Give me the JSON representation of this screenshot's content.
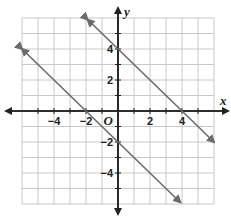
{
  "chart_data": {
    "type": "line",
    "title": "",
    "xlabel": "x",
    "ylabel": "y",
    "xlim": [
      -6,
      6
    ],
    "ylim": [
      -6,
      6
    ],
    "grid": true,
    "origin_label": "O",
    "x_ticks": [
      -4,
      -2,
      2,
      4
    ],
    "y_ticks": [
      4,
      2,
      -2,
      -4
    ],
    "x_tick_labels": [
      "−4",
      "−2",
      "2",
      "4"
    ],
    "y_tick_labels": [
      "4",
      "2",
      "−2",
      "−4"
    ],
    "series": [
      {
        "name": "line-upper",
        "equation": "y = -x + 4",
        "slope": -1,
        "intercept": 4,
        "x": [
          -1.9,
          6
        ],
        "y": [
          5.9,
          -2
        ],
        "color": "#6b6b6b"
      },
      {
        "name": "line-lower",
        "equation": "y = -x - 2",
        "slope": -1,
        "intercept": -2,
        "x": [
          -6,
          3.9
        ],
        "y": [
          4,
          -5.9
        ],
        "color": "#6b6b6b"
      }
    ],
    "colors": {
      "grid": "#c8c8c8",
      "axis": "#222222",
      "line": "#6b6b6b"
    }
  }
}
